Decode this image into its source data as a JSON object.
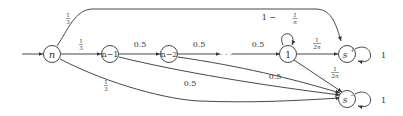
{
  "diagram": {
    "type": "markov-chain",
    "nodes": [
      {
        "id": "n",
        "label": "n"
      },
      {
        "id": "n-1",
        "label": "n−1"
      },
      {
        "id": "n-2",
        "label": "n−2"
      },
      {
        "id": "dots",
        "label": "· · ·"
      },
      {
        "id": "1",
        "label": "1"
      },
      {
        "id": "s+",
        "label": "s",
        "sup": "+"
      },
      {
        "id": "s-",
        "label": "s",
        "sup": "−"
      }
    ],
    "edges": [
      {
        "from": "start",
        "to": "n",
        "label": ""
      },
      {
        "from": "n",
        "to": "s+",
        "label_num": "1",
        "label_den": "3"
      },
      {
        "from": "n",
        "to": "n-1",
        "label_num": "1",
        "label_den": "3"
      },
      {
        "from": "n",
        "to": "s-",
        "label_num": "1",
        "label_den": "3"
      },
      {
        "from": "n-1",
        "to": "n-2",
        "label": "0.5"
      },
      {
        "from": "n-1",
        "to": "s-",
        "label": "0.5"
      },
      {
        "from": "n-2",
        "to": "dots",
        "label": "0.5"
      },
      {
        "from": "n-2",
        "to": "s-",
        "label": "0.5"
      },
      {
        "from": "dots",
        "to": "1",
        "label": "0.5"
      },
      {
        "from": "1",
        "to": "1",
        "label_prefix": "1 − ",
        "label_num": "1",
        "label_den": "n"
      },
      {
        "from": "1",
        "to": "s+",
        "label_num": "1",
        "label_den": "2n"
      },
      {
        "from": "1",
        "to": "s-",
        "label_num": "1",
        "label_den": "2n"
      },
      {
        "from": "s+",
        "to": "s+",
        "label": "1"
      },
      {
        "from": "s-",
        "to": "s-",
        "label": "1"
      }
    ]
  }
}
